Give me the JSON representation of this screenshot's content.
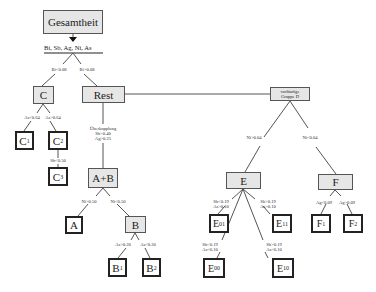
{
  "diagram": {
    "type": "decision-tree",
    "colors": {
      "inner_node_fill": "#e6e6e6",
      "leaf_fill": "#ffffff",
      "border": "#222222",
      "edge": "#555555"
    },
    "root": {
      "label": "Gesamtheit",
      "variables": "Bi, Sb, Ag, Ni, As"
    },
    "nodes": {
      "C": {
        "label": "C"
      },
      "C1": {
        "main": "C",
        "sub": "1"
      },
      "C2": {
        "main": "C",
        "sub": "2"
      },
      "C3": {
        "main": "C",
        "sub": "3"
      },
      "Rest": {
        "label": "Rest"
      },
      "AB": {
        "label": "A+B"
      },
      "A": {
        "label": "A"
      },
      "B": {
        "label": "B"
      },
      "B1": {
        "main": "B",
        "sub": "1"
      },
      "B2": {
        "main": "B",
        "sub": "2"
      },
      "D": {
        "line1": "vorläufige",
        "line2": "Gruppe D"
      },
      "E": {
        "label": "E"
      },
      "E01": {
        "main": "E",
        "sub": "01"
      },
      "E11": {
        "main": "E",
        "sub": "11"
      },
      "E00": {
        "main": "E",
        "sub": "00"
      },
      "E10": {
        "main": "E",
        "sub": "10"
      },
      "F": {
        "label": "F"
      },
      "F1": {
        "main": "F",
        "sub": "1"
      },
      "F2": {
        "main": "F",
        "sub": "2"
      }
    },
    "edge_labels": {
      "root_C": "Bi<0.08",
      "root_Rest": "Bi>0.08",
      "C_C1": "As<0.64",
      "C_C2": "As>0.64",
      "C2_C3": "Sb<0.50",
      "Rest_AB": {
        "line1": "Überkopplung",
        "line2": "Sb>0.40",
        "line3": "Ag>0.25"
      },
      "AB_A": "Ni>0.50",
      "AB_B": "Ni<0.50",
      "B_B1": "As>0.20",
      "B_B2": "As<0.20",
      "D_E": "Ni>0.04",
      "D_F": "Ni<0.04",
      "E_E01": {
        "line1": "Sb<0.19",
        "line2": "As>0.10"
      },
      "E_E11": {
        "line1": "Sb>0.19",
        "line2": "As>0.10"
      },
      "E_E00": {
        "line1": "Sb<0.19",
        "line2": "As<0.10"
      },
      "E_E10": {
        "line1": "Sb>0.19",
        "line2": "As<0.10"
      },
      "F_F1": "Ag<0.09",
      "F_F2": "Ag>0.09"
    }
  }
}
